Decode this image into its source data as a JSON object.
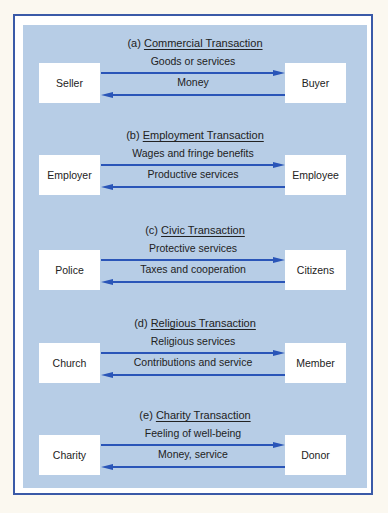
{
  "diagram": {
    "colors": {
      "background": "#fbf8f0",
      "frame_border": "#3a5aa8",
      "panel": "#b7cde6",
      "box": "#ffffff",
      "arrow": "#2a55b8"
    },
    "transactions": [
      {
        "prefix": "(a)",
        "title": "Commercial Transaction",
        "left_party": "Seller",
        "right_party": "Buyer",
        "to_right_label": "Goods or services",
        "to_left_label": "Money"
      },
      {
        "prefix": "(b)",
        "title": "Employment Transaction",
        "left_party": "Employer",
        "right_party": "Employee",
        "to_right_label": "Wages and fringe benefits",
        "to_left_label": "Productive services"
      },
      {
        "prefix": "(c)",
        "title": "Civic Transaction",
        "left_party": "Police",
        "right_party": "Citizens",
        "to_right_label": "Protective services",
        "to_left_label": "Taxes and cooperation"
      },
      {
        "prefix": "(d)",
        "title": "Religious Transaction",
        "left_party": "Church",
        "right_party": "Member",
        "to_right_label": "Religious services",
        "to_left_label": "Contributions and service"
      },
      {
        "prefix": "(e)",
        "title": "Charity Transaction",
        "left_party": "Charity",
        "right_party": "Donor",
        "to_right_label": "Feeling of well-being",
        "to_left_label": "Money, service"
      }
    ]
  }
}
